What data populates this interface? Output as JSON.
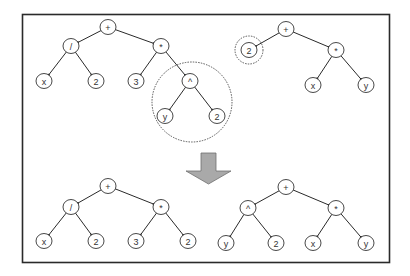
{
  "colors": {
    "line": "#2a2a2a",
    "arrow_fill": "#a9a9a9",
    "highlight": "#555555"
  },
  "trees": [
    {
      "id": "parent-1",
      "nodes": [
        {
          "id": "p1-root",
          "label": "+"
        },
        {
          "id": "p1-div",
          "label": "/"
        },
        {
          "id": "p1-mul",
          "label": "*"
        },
        {
          "id": "p1-x",
          "label": "x"
        },
        {
          "id": "p1-2a",
          "label": "2"
        },
        {
          "id": "p1-3",
          "label": "3"
        },
        {
          "id": "p1-pow",
          "label": "^"
        },
        {
          "id": "p1-y",
          "label": "y"
        },
        {
          "id": "p1-2b",
          "label": "2"
        }
      ],
      "edges": [
        [
          "p1-root",
          "p1-div"
        ],
        [
          "p1-root",
          "p1-mul"
        ],
        [
          "p1-div",
          "p1-x"
        ],
        [
          "p1-div",
          "p1-2a"
        ],
        [
          "p1-mul",
          "p1-3"
        ],
        [
          "p1-mul",
          "p1-pow"
        ],
        [
          "p1-pow",
          "p1-y"
        ],
        [
          "p1-pow",
          "p1-2b"
        ]
      ],
      "highlighted_subtree": "p1-pow"
    },
    {
      "id": "parent-2",
      "nodes": [
        {
          "id": "p2-root",
          "label": "+"
        },
        {
          "id": "p2-2",
          "label": "2"
        },
        {
          "id": "p2-mul",
          "label": "*"
        },
        {
          "id": "p2-x",
          "label": "x"
        },
        {
          "id": "p2-y",
          "label": "y"
        }
      ],
      "edges": [
        [
          "p2-root",
          "p2-2"
        ],
        [
          "p2-root",
          "p2-mul"
        ],
        [
          "p2-mul",
          "p2-x"
        ],
        [
          "p2-mul",
          "p2-y"
        ]
      ],
      "highlighted_subtree": "p2-2"
    },
    {
      "id": "child-1",
      "nodes": [
        {
          "id": "c1-root",
          "label": "+"
        },
        {
          "id": "c1-div",
          "label": "/"
        },
        {
          "id": "c1-mul",
          "label": "*"
        },
        {
          "id": "c1-x",
          "label": "x"
        },
        {
          "id": "c1-2a",
          "label": "2"
        },
        {
          "id": "c1-3",
          "label": "3"
        },
        {
          "id": "c1-2b",
          "label": "2"
        }
      ],
      "edges": [
        [
          "c1-root",
          "c1-div"
        ],
        [
          "c1-root",
          "c1-mul"
        ],
        [
          "c1-div",
          "c1-x"
        ],
        [
          "c1-div",
          "c1-2a"
        ],
        [
          "c1-mul",
          "c1-3"
        ],
        [
          "c1-mul",
          "c1-2b"
        ]
      ]
    },
    {
      "id": "child-2",
      "nodes": [
        {
          "id": "c2-root",
          "label": "+"
        },
        {
          "id": "c2-pow",
          "label": "^"
        },
        {
          "id": "c2-mul",
          "label": "*"
        },
        {
          "id": "c2-y1",
          "label": "y"
        },
        {
          "id": "c2-2",
          "label": "2"
        },
        {
          "id": "c2-x",
          "label": "x"
        },
        {
          "id": "c2-y2",
          "label": "y"
        }
      ],
      "edges": [
        [
          "c2-root",
          "c2-pow"
        ],
        [
          "c2-root",
          "c2-mul"
        ],
        [
          "c2-pow",
          "c2-y1"
        ],
        [
          "c2-pow",
          "c2-2"
        ],
        [
          "c2-mul",
          "c2-x"
        ],
        [
          "c2-mul",
          "c2-y2"
        ]
      ]
    }
  ],
  "arrow": {
    "direction": "down",
    "meaning": "crossover result"
  }
}
